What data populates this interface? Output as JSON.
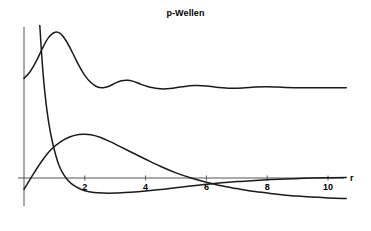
{
  "chart_data": {
    "type": "line",
    "title": "p-Wellen",
    "xlabel": "r",
    "ylabel": "",
    "grid": false,
    "legend": "none",
    "xlim": [
      0,
      10.6
    ],
    "xticks": [
      2,
      4,
      6,
      8,
      10
    ],
    "xtick_labels": [
      "2",
      "4",
      "6",
      "8",
      "10"
    ],
    "axis_color": "#555555",
    "curve_color": "#1a1a1a",
    "series": [
      {
        "name": "oscillating-upper-curve",
        "comment": "damped oscillation settling to a constant upper level",
        "x": [
          0.0,
          0.2,
          0.4,
          0.6,
          0.8,
          1.0,
          1.2,
          1.4,
          1.6,
          1.8,
          2.0,
          2.2,
          2.4,
          2.6,
          2.8,
          3.0,
          3.2,
          3.4,
          3.6,
          3.8,
          4.0,
          4.4,
          4.8,
          5.2,
          5.6,
          6.0,
          6.4,
          6.8,
          7.2,
          7.6,
          8.0,
          8.6,
          9.2,
          10.0,
          10.6
        ],
        "y": [
          3.3,
          3.52,
          3.86,
          4.28,
          4.64,
          4.82,
          4.78,
          4.52,
          4.14,
          3.74,
          3.4,
          3.16,
          3.02,
          2.99,
          3.04,
          3.14,
          3.22,
          3.24,
          3.2,
          3.12,
          3.05,
          2.96,
          2.96,
          3.02,
          3.06,
          3.05,
          3.0,
          2.97,
          2.98,
          3.01,
          3.02,
          3.0,
          2.99,
          2.99,
          2.99
        ]
      },
      {
        "name": "radial-distribution-hump",
        "comment": "broad hump peaking near r = 2, decaying to slight negative tail",
        "x": [
          0.0,
          0.3,
          0.6,
          0.9,
          1.2,
          1.5,
          1.8,
          2.0,
          2.2,
          2.5,
          2.8,
          3.2,
          3.6,
          4.0,
          4.5,
          5.0,
          5.5,
          6.0,
          6.5,
          7.0,
          7.6,
          8.2,
          9.0,
          10.0,
          10.6
        ],
        "y": [
          -0.38,
          0.12,
          0.58,
          0.95,
          1.2,
          1.36,
          1.44,
          1.45,
          1.43,
          1.35,
          1.22,
          1.02,
          0.82,
          0.62,
          0.38,
          0.17,
          0.0,
          -0.14,
          -0.26,
          -0.35,
          -0.45,
          -0.52,
          -0.6,
          -0.66,
          -0.68
        ]
      },
      {
        "name": "steep-decaying-curve",
        "comment": "sharp decay from large value at small r, shallow minimum then slow rise crossing zero",
        "x": [
          0.52,
          0.58,
          0.66,
          0.76,
          0.88,
          1.0,
          1.15,
          1.3,
          1.45,
          1.6,
          1.8,
          2.0,
          2.3,
          2.6,
          3.0,
          3.5,
          4.0,
          4.6,
          5.2,
          5.8,
          6.2,
          6.6,
          7.0,
          7.6,
          8.4,
          9.2,
          10.0,
          10.6
        ],
        "y": [
          5.05,
          4.1,
          3.1,
          2.2,
          1.45,
          0.92,
          0.42,
          0.12,
          -0.08,
          -0.22,
          -0.34,
          -0.42,
          -0.48,
          -0.5,
          -0.5,
          -0.47,
          -0.43,
          -0.37,
          -0.3,
          -0.23,
          -0.19,
          -0.15,
          -0.12,
          -0.08,
          -0.04,
          -0.01,
          0.01,
          0.02
        ]
      }
    ]
  },
  "axes": {
    "y_axis_name": "y-axis-line",
    "x_axis_name": "x-axis-line"
  }
}
